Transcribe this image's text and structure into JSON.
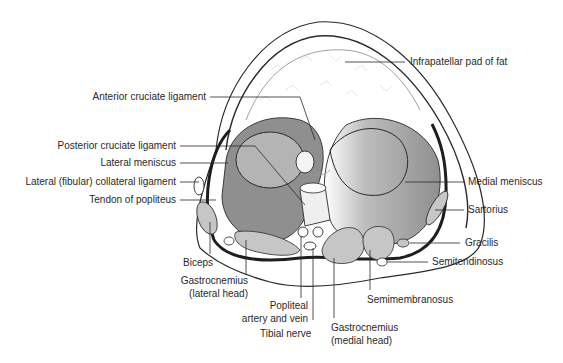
{
  "figure": {
    "colors": {
      "outline": "#2a2a2a",
      "meniscus_fill": "#8f8f8f",
      "condyle_fill": "#b4b4b4",
      "muscle_fill": "#c6c6c6",
      "capsule": "#1e1e1e",
      "background": "#ffffff"
    }
  },
  "labels": {
    "infrapatellar_pad": "Infrapatellar pad of fat",
    "acl": "Anterior cruciate ligament",
    "pcl": "Posterior cruciate ligament",
    "lateral_meniscus": "Lateral meniscus",
    "lcl": "Lateral (fibular) collateral ligament",
    "popliteus_tendon": "Tendon of popliteus",
    "medial_meniscus": "Medial meniscus",
    "sartorius": "Sartorius",
    "gracilis": "Gracilis",
    "semitendinosus": "Semitendinosus",
    "biceps": "Biceps",
    "gastroc_lateral_1": "Gastrocnemius",
    "gastroc_lateral_2": "(lateral head)",
    "popliteal_1": "Popliteal",
    "popliteal_2": "artery and vein",
    "tibial_nerve": "Tibial nerve",
    "semimembranosus": "Semimembranosus",
    "gastroc_medial_1": "Gastrocnemius",
    "gastroc_medial_2": "(medial head)"
  }
}
